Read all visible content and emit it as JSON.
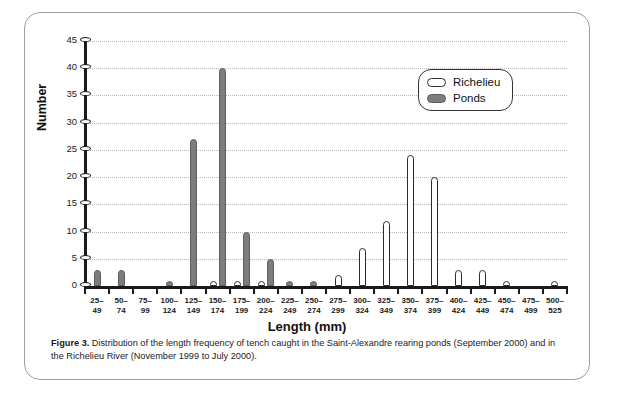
{
  "figure": {
    "caption_label": "Figure 3.",
    "caption_text": " Distribution of the length frequency of tench caught in the Saint-Alexandre rearing ponds (September 2000) and in the Richelieu River (November 1999 to July 2000)."
  },
  "legend": {
    "position": "top-right",
    "entries": [
      {
        "label": "Richelieu",
        "swatch": "hollow-pill",
        "color": "#ffffff"
      },
      {
        "label": "Ponds",
        "swatch": "filled-pill",
        "color": "#7d7d7d"
      }
    ]
  },
  "chart_data": {
    "type": "bar",
    "title": "",
    "xlabel": "Length (mm)",
    "ylabel": "Number",
    "ylim": [
      0,
      45
    ],
    "yticks": [
      0,
      5,
      10,
      15,
      20,
      25,
      30,
      35,
      40,
      45
    ],
    "grid": true,
    "categories": [
      "25–\n49",
      "50–\n74",
      "75–\n99",
      "100–\n124",
      "125–\n149",
      "150–\n174",
      "175–\n199",
      "200–\n224",
      "225–\n249",
      "250–\n274",
      "275–\n299",
      "300–\n324",
      "325–\n349",
      "350–\n374",
      "375–\n399",
      "400–\n424",
      "425–\n449",
      "450–\n474",
      "475–\n499",
      "500–\n525"
    ],
    "series": [
      {
        "name": "Richelieu",
        "color": "#ffffff",
        "values": [
          0,
          0,
          0,
          0,
          0,
          1,
          1,
          1,
          0,
          0,
          2,
          7,
          12,
          24,
          20,
          3,
          3,
          1,
          0,
          1
        ]
      },
      {
        "name": "Ponds",
        "color": "#7d7d7d",
        "values": [
          3,
          3,
          0,
          1,
          27,
          40,
          10,
          5,
          1,
          1,
          0,
          0,
          0,
          0,
          0,
          0,
          0,
          0,
          0,
          0
        ]
      }
    ]
  }
}
